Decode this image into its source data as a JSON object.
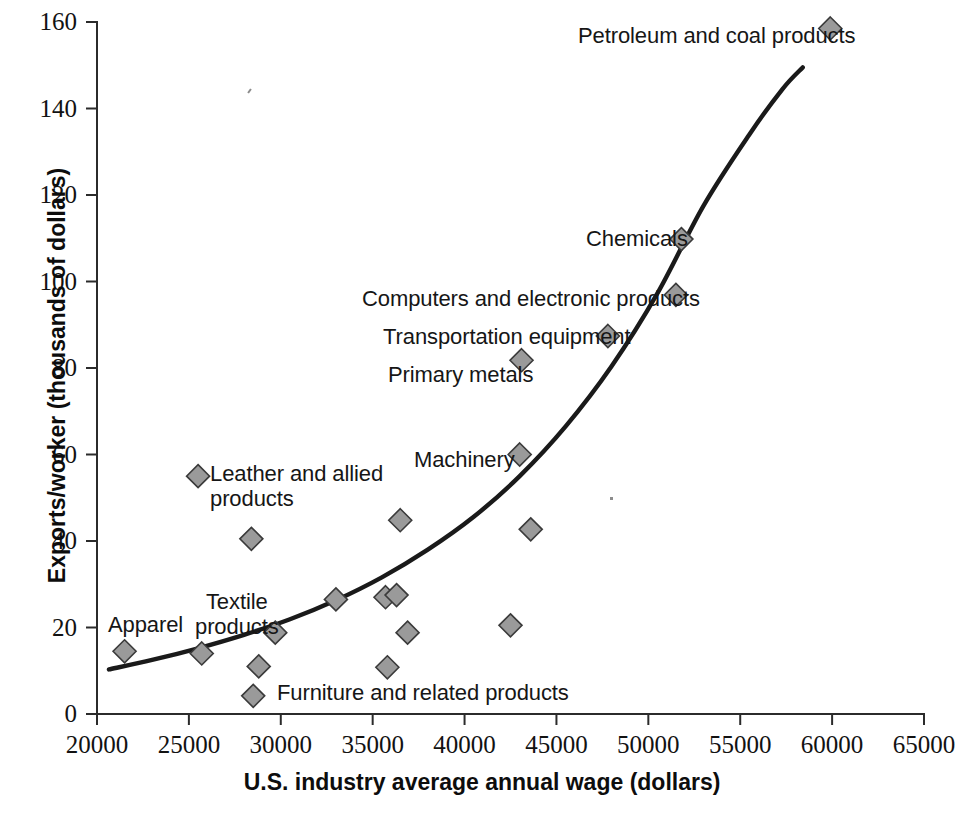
{
  "chart_data": {
    "type": "scatter",
    "title": "",
    "xlabel": "U.S. industry average annual wage (dollars)",
    "ylabel": "Exports/worker (thousands of dollars)",
    "xlim": [
      20000,
      65000
    ],
    "ylim": [
      0,
      160
    ],
    "xticks": [
      20000,
      25000,
      30000,
      35000,
      40000,
      45000,
      50000,
      55000,
      60000,
      65000
    ],
    "yticks": [
      0,
      20,
      40,
      60,
      80,
      100,
      120,
      140,
      160
    ],
    "xtick_labels": [
      "20000",
      "25000",
      "30000",
      "35000",
      "40000",
      "45000",
      "50000",
      "55000",
      "60000",
      "65000"
    ],
    "ytick_labels": [
      "0",
      "20",
      "40",
      "60",
      "80",
      "100",
      "120",
      "140",
      "160"
    ],
    "grid": false,
    "legend": "none",
    "marker_shape": "diamond",
    "marker_fill": "#9a9a9a",
    "marker_stroke": "#3a3a3a",
    "points": [
      {
        "label": "Apparel",
        "x": 21500,
        "y": 14.5
      },
      {
        "label": "",
        "x": 25700,
        "y": 14.0
      },
      {
        "label": "Textile products",
        "x": 29700,
        "y": 18.8
      },
      {
        "label": "",
        "x": 28400,
        "y": 40.5
      },
      {
        "label": "Leather and allied products",
        "x": 25500,
        "y": 55.0
      },
      {
        "label": "",
        "x": 28800,
        "y": 11.0
      },
      {
        "label": "Furniture and related products",
        "x": 28500,
        "y": 4.2
      },
      {
        "label": "",
        "x": 33000,
        "y": 26.5
      },
      {
        "label": "",
        "x": 35700,
        "y": 27.0
      },
      {
        "label": "",
        "x": 36300,
        "y": 27.5
      },
      {
        "label": "",
        "x": 36500,
        "y": 44.8
      },
      {
        "label": "",
        "x": 36900,
        "y": 18.8
      },
      {
        "label": "",
        "x": 35800,
        "y": 10.8
      },
      {
        "label": "Machinery",
        "x": 43000,
        "y": 60.0
      },
      {
        "label": "",
        "x": 43600,
        "y": 42.7
      },
      {
        "label": "",
        "x": 42500,
        "y": 20.5
      },
      {
        "label": "Primary metals",
        "x": 43100,
        "y": 81.8
      },
      {
        "label": "Transportation equipment",
        "x": 47800,
        "y": 87.4
      },
      {
        "label": "Computers and electronic products",
        "x": 51500,
        "y": 96.9
      },
      {
        "label": "Chemicals",
        "x": 51800,
        "y": 109.8
      },
      {
        "label": "Petroleum and coal products",
        "x": 59900,
        "y": 158.5
      }
    ],
    "trend_curve": {
      "description": "exponential-like fitted curve",
      "points": [
        {
          "x": 20650,
          "y": 10.3
        },
        {
          "x": 23000,
          "y": 12.5
        },
        {
          "x": 25500,
          "y": 15.2
        },
        {
          "x": 28000,
          "y": 18.3
        },
        {
          "x": 30500,
          "y": 21.9
        },
        {
          "x": 33000,
          "y": 26.3
        },
        {
          "x": 35500,
          "y": 31.6
        },
        {
          "x": 38000,
          "y": 38.0
        },
        {
          "x": 40500,
          "y": 45.6
        },
        {
          "x": 43000,
          "y": 55.0
        },
        {
          "x": 45500,
          "y": 66.5
        },
        {
          "x": 48000,
          "y": 80.4
        },
        {
          "x": 50500,
          "y": 97.3
        },
        {
          "x": 53000,
          "y": 117.5
        },
        {
          "x": 55500,
          "y": 134.0
        },
        {
          "x": 57300,
          "y": 144.5
        },
        {
          "x": 58400,
          "y": 149.5
        }
      ]
    },
    "point_labels": [
      {
        "name": "apparel",
        "text": "Apparel",
        "left": 108,
        "top": 613,
        "align": "left"
      },
      {
        "name": "textile-products",
        "text": "Textile\nproducts",
        "left": 195,
        "top": 590,
        "align": "center"
      },
      {
        "name": "leather-and-allied-products",
        "text": "Leather and allied\nproducts",
        "left": 210,
        "top": 462,
        "align": "left"
      },
      {
        "name": "furniture-and-related-products",
        "text": "Furniture and related products",
        "left": 277,
        "top": 681,
        "align": "left"
      },
      {
        "name": "machinery",
        "text": "Machinery",
        "left": 414,
        "top": 448,
        "align": "left"
      },
      {
        "name": "primary-metals",
        "text": "Primary metals",
        "left": 388,
        "top": 363,
        "align": "left"
      },
      {
        "name": "transportation-equipment",
        "text": "Transportation equipment",
        "left": 383,
        "top": 325,
        "align": "left"
      },
      {
        "name": "computers-and-electronic-products",
        "text": "Computers and electronic products",
        "left": 362,
        "top": 287,
        "align": "left"
      },
      {
        "name": "chemicals",
        "text": "Chemicals",
        "left": 586,
        "top": 227,
        "align": "left"
      },
      {
        "name": "petroleum-and-coal-products",
        "text": "Petroleum and coal products",
        "left": 578,
        "top": 24,
        "align": "left"
      }
    ]
  },
  "geometry": {
    "x0_px": 97,
    "x1_px": 924,
    "y0_px": 714,
    "y1_px": 22
  }
}
